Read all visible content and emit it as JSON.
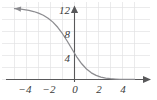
{
  "chart_data": {
    "type": "line",
    "title": "",
    "subtitle": "",
    "xlabel": "",
    "ylabel": "",
    "xlim": [
      -5.0,
      5.2
    ],
    "ylim": [
      -1.2,
      12.8
    ],
    "grid": true,
    "grid_color": "#e2e2e4",
    "grid_spacing_x": 1,
    "grid_spacing_y": 2,
    "legend": "none",
    "axis_color": "#58585a",
    "curve_color": "#8c8c90",
    "background": "#ffffff",
    "x_ticks": [
      -4,
      -2,
      0,
      2,
      4
    ],
    "x_tick_labels": [
      "−4",
      "−2",
      "0",
      "2",
      "4"
    ],
    "y_ticks": [
      4,
      8,
      12
    ],
    "y_tick_labels": [
      "4",
      "8",
      "12"
    ],
    "axis_arrows": {
      "y_axis_top": "arrowhead-up",
      "x_axis_right": "arrowhead-right",
      "curve_left_end": "arrowhead-left"
    },
    "series": [
      {
        "name": "logistic decay",
        "description": "Decreasing sigmoid curve approaching 12 on the left and 0 on the right",
        "x": [
          -5.0,
          -4.6,
          -4.2,
          -3.8,
          -3.4,
          -3.0,
          -2.6,
          -2.2,
          -1.8,
          -1.4,
          -1.0,
          -0.6,
          -0.2,
          0.0,
          0.2,
          0.6,
          1.0,
          1.4,
          1.8,
          2.2,
          2.6,
          3.0,
          3.4,
          3.8,
          4.2,
          4.6,
          5.0
        ],
        "y": [
          11.83,
          11.76,
          11.66,
          11.52,
          11.33,
          11.07,
          10.71,
          10.22,
          9.56,
          8.7,
          7.63,
          6.38,
          5.04,
          4.37,
          3.74,
          2.62,
          1.75,
          1.11,
          0.68,
          0.4,
          0.23,
          0.13,
          0.08,
          0.04,
          0.02,
          0.01,
          0.01
        ]
      }
    ],
    "asymptotes": {
      "left_limit": 12,
      "right_limit": 0
    },
    "y_intercept": 4.37
  },
  "figure": {
    "width": 157,
    "height": 100
  }
}
